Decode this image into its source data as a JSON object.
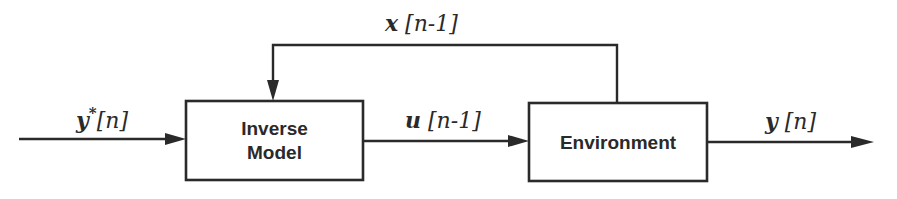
{
  "diagram": {
    "type": "block-diagram",
    "colors": {
      "ink": "#2a2a2a",
      "background": "#ffffff"
    },
    "blocks": [
      {
        "id": "inverse-model",
        "label_lines": [
          "Inverse",
          "Model"
        ]
      },
      {
        "id": "environment",
        "label_lines": [
          "Environment"
        ]
      }
    ],
    "signals": {
      "input": {
        "var": "y",
        "sup": "*",
        "index": "[n]"
      },
      "control": {
        "var": "u",
        "index": " [n-1]"
      },
      "feedback": {
        "var": "x",
        "index": " [n-1]"
      },
      "output": {
        "var": "y",
        "index": " [n]"
      }
    },
    "connections": [
      {
        "from": "external",
        "to": "inverse-model",
        "signal": "input"
      },
      {
        "from": "inverse-model",
        "to": "environment",
        "signal": "control"
      },
      {
        "from": "environment",
        "to": "inverse-model",
        "signal": "feedback"
      },
      {
        "from": "environment",
        "to": "external",
        "signal": "output"
      }
    ]
  }
}
